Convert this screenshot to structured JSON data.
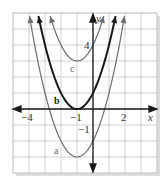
{
  "chart_data": {
    "type": "line",
    "title": "",
    "xlabel": "x",
    "ylabel": "y",
    "xlim": [
      -5,
      4
    ],
    "ylim": [
      -4,
      6
    ],
    "grid": true,
    "tick_labels": {
      "x": [
        {
          "value": -4,
          "label": "−4"
        },
        {
          "value": -1,
          "label": "−1"
        },
        {
          "value": 2,
          "label": "2"
        }
      ],
      "y": [
        {
          "value": 4,
          "label": "4"
        },
        {
          "value": -1,
          "label": "−1"
        }
      ]
    },
    "series": [
      {
        "name": "a",
        "equation": "y = (x+1)^2 - 3",
        "vertex": [
          -1,
          -3
        ],
        "color": "#6e6e6e",
        "width": 1.2
      },
      {
        "name": "b",
        "equation": "y = (x+1)^2",
        "vertex": [
          -1,
          0
        ],
        "color": "#1a1a1a",
        "width": 2.0
      },
      {
        "name": "c",
        "equation": "y = (x+1)^2 + 3",
        "vertex": [
          -1,
          3
        ],
        "color": "#6e6e6e",
        "width": 1.2
      }
    ],
    "curve_labels": [
      {
        "text": "a",
        "x": -2.9,
        "y": -2.6
      },
      {
        "text": "b",
        "x": -2.6,
        "y": 0.8
      },
      {
        "text": "c",
        "x": -1.9,
        "y": 3.5
      }
    ]
  },
  "labels": {
    "x_axis": "x",
    "y_axis": "y",
    "tick_x_neg4": "−4",
    "tick_x_neg1": "−1",
    "tick_x_2": "2",
    "tick_y_4": "4",
    "tick_y_neg1": "−1",
    "curve_a": "a",
    "curve_b": "b",
    "curve_c": "c"
  },
  "colors": {
    "grid": "#c8c8c8",
    "axis": "#1a1a1a",
    "thin_curve": "#6e6e6e",
    "bold_curve": "#1a1a1a",
    "frame_shadow": "#d9d9d9"
  }
}
